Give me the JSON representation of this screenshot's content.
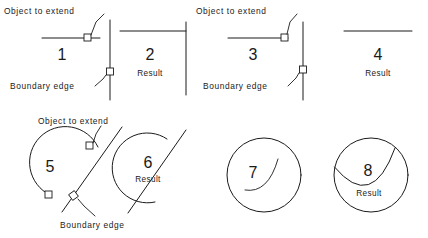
{
  "diagram": {
    "stroke_color": "#1a1a1a",
    "background_color": "#ffffff",
    "labels": {
      "object_to_extend": "Object to extend",
      "boundary_edge": "Boundary edge",
      "result": "Result"
    },
    "panels": [
      {
        "number": "1",
        "kind": "before",
        "label": "",
        "annotations": [
          "Object to extend",
          "Boundary edge"
        ]
      },
      {
        "number": "2",
        "kind": "after",
        "label": "Result",
        "annotations": []
      },
      {
        "number": "3",
        "kind": "before",
        "label": "",
        "annotations": [
          "Object to extend",
          "Boundary edge"
        ]
      },
      {
        "number": "4",
        "kind": "after",
        "label": "Result",
        "annotations": []
      },
      {
        "number": "5",
        "kind": "before",
        "label": "",
        "annotations": [
          "Object to extend",
          "Boundary edge"
        ]
      },
      {
        "number": "6",
        "kind": "after",
        "label": "Result",
        "annotations": []
      },
      {
        "number": "7",
        "kind": "before",
        "label": "",
        "annotations": []
      },
      {
        "number": "8",
        "kind": "after",
        "label": "Result",
        "annotations": []
      }
    ]
  }
}
